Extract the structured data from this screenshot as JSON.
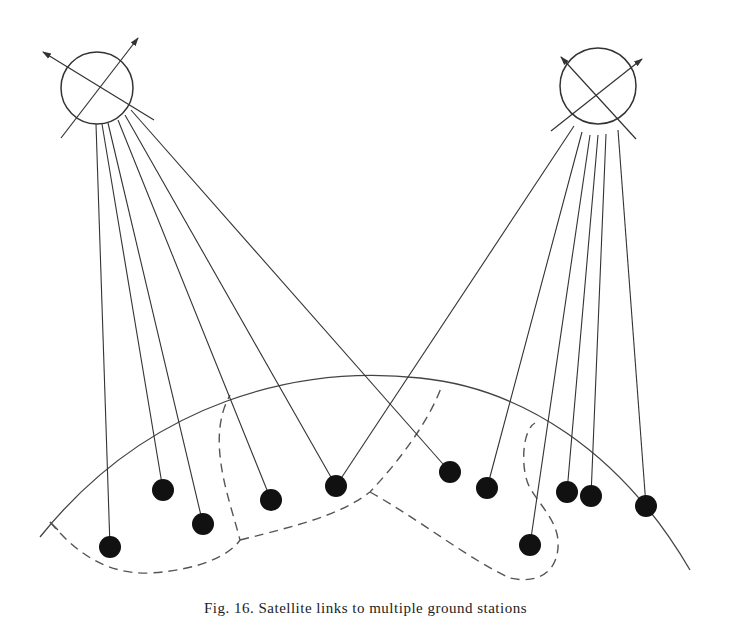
{
  "figure": {
    "caption": "Fig. 16. Satellite links to multiple ground stations",
    "stroke_color": "#333333",
    "fill_color": "#111111",
    "satellites": [
      {
        "id": "left",
        "cx": 97,
        "cy": 88,
        "r": 36
      },
      {
        "id": "right",
        "cx": 598,
        "cy": 86,
        "r": 38
      }
    ],
    "ground_stations": [
      {
        "x": 110,
        "y": 547
      },
      {
        "x": 163,
        "y": 490
      },
      {
        "x": 203,
        "y": 524
      },
      {
        "x": 271,
        "y": 500
      },
      {
        "x": 336,
        "y": 486
      },
      {
        "x": 450,
        "y": 472
      },
      {
        "x": 487,
        "y": 488
      },
      {
        "x": 530,
        "y": 545
      },
      {
        "x": 567,
        "y": 492
      },
      {
        "x": 591,
        "y": 496
      },
      {
        "x": 646,
        "y": 506
      }
    ],
    "links_left_satellite": [
      0,
      1,
      2,
      3,
      4,
      5
    ],
    "links_right_satellite": [
      4,
      6,
      7,
      8,
      9,
      10
    ]
  }
}
